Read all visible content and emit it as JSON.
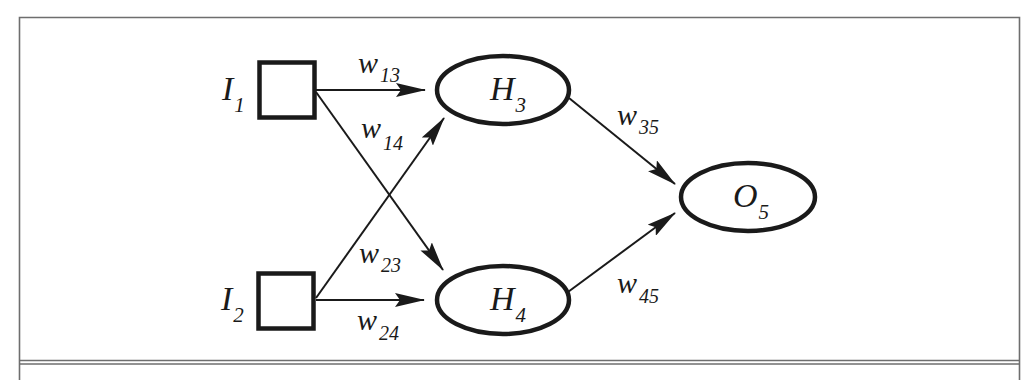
{
  "diagram": {
    "type": "feedforward-neural-network",
    "colors": {
      "stroke": "#1a1a1a",
      "frame": "#6e6e6e",
      "background": "#ffffff"
    },
    "nodes": {
      "I1": {
        "letter": "I",
        "index": "1",
        "shape": "square",
        "layer": "input"
      },
      "I2": {
        "letter": "I",
        "index": "2",
        "shape": "square",
        "layer": "input"
      },
      "H3": {
        "letter": "H",
        "index": "3",
        "shape": "ellipse",
        "layer": "hidden"
      },
      "H4": {
        "letter": "H",
        "index": "4",
        "shape": "ellipse",
        "layer": "hidden"
      },
      "O5": {
        "letter": "O",
        "index": "5",
        "shape": "ellipse",
        "layer": "output"
      }
    },
    "edges": {
      "w13": {
        "from": "I1",
        "to": "H3",
        "letter": "w",
        "index": "13"
      },
      "w14": {
        "from": "I1",
        "to": "H4",
        "letter": "w",
        "index": "14"
      },
      "w23": {
        "from": "I2",
        "to": "H3",
        "letter": "w",
        "index": "23"
      },
      "w24": {
        "from": "I2",
        "to": "H4",
        "letter": "w",
        "index": "24"
      },
      "w35": {
        "from": "H3",
        "to": "O5",
        "letter": "w",
        "index": "35"
      },
      "w45": {
        "from": "H4",
        "to": "O5",
        "letter": "w",
        "index": "45"
      }
    }
  }
}
